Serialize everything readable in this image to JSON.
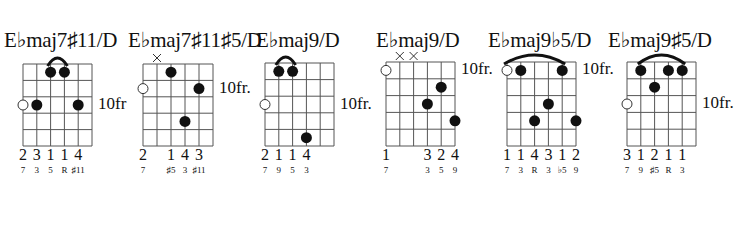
{
  "diagram": {
    "type": "guitar-chord-chart",
    "strings": 6,
    "frets_shown": 5,
    "colors": {
      "line": "#555555",
      "dot": "#111111",
      "background": "#ffffff"
    },
    "chords": [
      {
        "name": "E♭maj7♯11/D",
        "position_label": "10fr",
        "position_row": 3,
        "grid": {
          "x": 23,
          "y": 64,
          "w": 69,
          "h": 82
        },
        "title_x": 4,
        "muted": [],
        "open_circles": [
          {
            "string": 1,
            "fret": 3
          }
        ],
        "dots": [
          {
            "string": 2,
            "fret": 3
          },
          {
            "string": 3,
            "fret": 1
          },
          {
            "string": 4,
            "fret": 1
          },
          {
            "string": 5,
            "fret": 3
          }
        ],
        "barre": {
          "from": 3,
          "to": 4
        },
        "fingers": [
          {
            "string": 1,
            "label": "2"
          },
          {
            "string": 2,
            "label": "3"
          },
          {
            "string": 3,
            "label": "1"
          },
          {
            "string": 4,
            "label": "1"
          },
          {
            "string": 5,
            "label": "4"
          }
        ],
        "intervals": [
          {
            "string": 1,
            "label": "7"
          },
          {
            "string": 2,
            "label": "3"
          },
          {
            "string": 3,
            "label": "5"
          },
          {
            "string": 4,
            "label": "R"
          },
          {
            "string": 5,
            "label": "♯11"
          }
        ]
      },
      {
        "name": "E♭maj7♯11♯5/D",
        "position_label": "10fr.",
        "position_row": 2,
        "grid": {
          "x": 143,
          "y": 64,
          "w": 70,
          "h": 82
        },
        "title_x": 128,
        "muted": [
          2
        ],
        "open_circles": [
          {
            "string": 1,
            "fret": 2
          }
        ],
        "dots": [
          {
            "string": 3,
            "fret": 1
          },
          {
            "string": 4,
            "fret": 4
          },
          {
            "string": 5,
            "fret": 2
          }
        ],
        "barre": null,
        "fingers": [
          {
            "string": 1,
            "label": "2"
          },
          {
            "string": 3,
            "label": "1"
          },
          {
            "string": 4,
            "label": "4"
          },
          {
            "string": 5,
            "label": "3"
          }
        ],
        "intervals": [
          {
            "string": 1,
            "label": "7"
          },
          {
            "string": 3,
            "label": "♯5"
          },
          {
            "string": 4,
            "label": "3"
          },
          {
            "string": 5,
            "label": "♯11"
          }
        ]
      },
      {
        "name": "E♭maj9/D",
        "position_label": "10fr.",
        "position_row": 3,
        "grid": {
          "x": 265,
          "y": 63,
          "w": 69,
          "h": 83
        },
        "title_x": 256,
        "muted": [],
        "open_circles": [
          {
            "string": 1,
            "fret": 3
          }
        ],
        "dots": [
          {
            "string": 2,
            "fret": 1
          },
          {
            "string": 3,
            "fret": 1
          },
          {
            "string": 4,
            "fret": 5
          }
        ],
        "barre": {
          "from": 2,
          "to": 3
        },
        "fingers": [
          {
            "string": 1,
            "label": "2"
          },
          {
            "string": 2,
            "label": "1"
          },
          {
            "string": 3,
            "label": "1"
          },
          {
            "string": 4,
            "label": "4"
          }
        ],
        "intervals": [
          {
            "string": 1,
            "label": "7"
          },
          {
            "string": 2,
            "label": "9"
          },
          {
            "string": 3,
            "label": "5"
          },
          {
            "string": 4,
            "label": "3"
          }
        ]
      },
      {
        "name": "E♭maj9/D",
        "position_label": "10fr.",
        "position_row": 1,
        "grid": {
          "x": 386,
          "y": 62,
          "w": 69,
          "h": 84
        },
        "title_x": 376,
        "muted": [
          2,
          3
        ],
        "open_circles": [
          {
            "string": 1,
            "fret": 1
          }
        ],
        "dots": [
          {
            "string": 5,
            "fret": 2
          },
          {
            "string": 4,
            "fret": 3
          },
          {
            "string": 6,
            "fret": 4
          }
        ],
        "barre": null,
        "fingers": [
          {
            "string": 1,
            "label": "1"
          },
          {
            "string": 4,
            "label": "3"
          },
          {
            "string": 5,
            "label": "2"
          },
          {
            "string": 6,
            "label": "4"
          }
        ],
        "intervals": [
          {
            "string": 1,
            "label": "7"
          },
          {
            "string": 4,
            "label": "3"
          },
          {
            "string": 5,
            "label": "5"
          },
          {
            "string": 6,
            "label": "9"
          }
        ]
      },
      {
        "name": "E♭maj9♭5/D",
        "position_label": "10fr.",
        "position_row": 1,
        "grid": {
          "x": 507,
          "y": 62,
          "w": 69,
          "h": 84
        },
        "title_x": 488,
        "muted": [],
        "open_circles": [
          {
            "string": 1,
            "fret": 1
          }
        ],
        "dots": [
          {
            "string": 2,
            "fret": 1
          },
          {
            "string": 5,
            "fret": 1
          },
          {
            "string": 4,
            "fret": 3
          },
          {
            "string": 3,
            "fret": 4
          },
          {
            "string": 6,
            "fret": 4
          }
        ],
        "barre": {
          "from": 1,
          "to": 5
        },
        "fingers": [
          {
            "string": 1,
            "label": "1"
          },
          {
            "string": 2,
            "label": "1"
          },
          {
            "string": 3,
            "label": "4"
          },
          {
            "string": 4,
            "label": "3"
          },
          {
            "string": 5,
            "label": "1"
          },
          {
            "string": 6,
            "label": "2"
          }
        ],
        "intervals": [
          {
            "string": 1,
            "label": "7"
          },
          {
            "string": 2,
            "label": "3"
          },
          {
            "string": 3,
            "label": "R"
          },
          {
            "string": 4,
            "label": "3"
          },
          {
            "string": 5,
            "label": "♭5"
          },
          {
            "string": 6,
            "label": "9"
          }
        ]
      },
      {
        "name": "E♭maj9♯5/D",
        "position_label": "10fr.",
        "position_row": 3,
        "grid": {
          "x": 627,
          "y": 62,
          "w": 69,
          "h": 84
        },
        "title_x": 608,
        "muted": [],
        "open_circles": [
          {
            "string": 1,
            "fret": 3
          }
        ],
        "dots": [
          {
            "string": 2,
            "fret": 1
          },
          {
            "string": 4,
            "fret": 1
          },
          {
            "string": 5,
            "fret": 1
          },
          {
            "string": 3,
            "fret": 2
          }
        ],
        "barre": {
          "from": 2,
          "to": 5
        },
        "fingers": [
          {
            "string": 1,
            "label": "3"
          },
          {
            "string": 2,
            "label": "1"
          },
          {
            "string": 3,
            "label": "2"
          },
          {
            "string": 4,
            "label": "1"
          },
          {
            "string": 5,
            "label": "1"
          }
        ],
        "intervals": [
          {
            "string": 1,
            "label": "7"
          },
          {
            "string": 2,
            "label": "9"
          },
          {
            "string": 3,
            "label": "♯5"
          },
          {
            "string": 4,
            "label": "R"
          },
          {
            "string": 5,
            "label": "3"
          }
        ]
      }
    ]
  }
}
